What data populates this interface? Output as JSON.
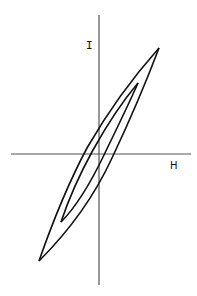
{
  "diagram": {
    "axes": {
      "x_label": "H",
      "y_label": "I"
    },
    "loops": [
      {
        "name": "outer-loop",
        "tip_positive": [
          159,
          48
        ],
        "tip_negative": [
          39,
          261
        ]
      },
      {
        "name": "inner-loop",
        "tip_positive": [
          138,
          83
        ],
        "tip_negative": [
          61,
          222
        ]
      }
    ],
    "colors": {
      "stroke": "#111111",
      "axis": "#555555",
      "background": "#ffffff"
    }
  }
}
